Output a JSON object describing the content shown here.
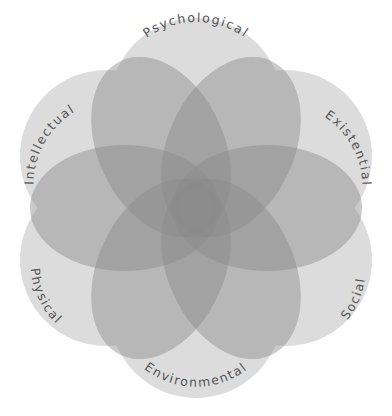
{
  "dimensions": [
    {
      "key": "psychological",
      "label": "Psychological"
    },
    {
      "key": "existential",
      "label": "Existential"
    },
    {
      "key": "social",
      "label": "Social"
    },
    {
      "key": "environmental",
      "label": "Environmental"
    },
    {
      "key": "physical",
      "label": "Physical"
    },
    {
      "key": "intellectual",
      "label": "Intellectual"
    }
  ],
  "colors": {
    "outer_circle": "#dcdcdc",
    "inner_petal": "#8a8a8a",
    "label_text": "#555555",
    "background": "#ffffff"
  }
}
